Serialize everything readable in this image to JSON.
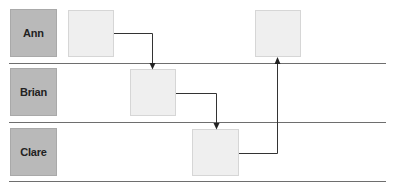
{
  "diagram": {
    "type": "swimlane-flow",
    "lanes": [
      {
        "id": "ann",
        "label": "Ann"
      },
      {
        "id": "brian",
        "label": "Brian"
      },
      {
        "id": "clare",
        "label": "Clare"
      }
    ],
    "tasks": [
      {
        "id": "t1",
        "lane": "ann",
        "label": ""
      },
      {
        "id": "t2",
        "lane": "brian",
        "label": ""
      },
      {
        "id": "t3",
        "lane": "clare",
        "label": ""
      },
      {
        "id": "t4",
        "lane": "ann",
        "label": ""
      }
    ],
    "connectors": [
      {
        "from": "t1",
        "to": "t2",
        "direction": "down"
      },
      {
        "from": "t2",
        "to": "t3",
        "direction": "down"
      },
      {
        "from": "t3",
        "to": "t4",
        "direction": "up"
      }
    ],
    "colors": {
      "lane_label_fill": "#b9b9b9",
      "task_fill": "#efefef",
      "line": "#6e6e6e",
      "connector": "#333333",
      "label_text": "#222222"
    }
  }
}
